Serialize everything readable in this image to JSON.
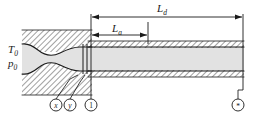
{
  "figure": {
    "colors": {
      "line": "#1a1a1a",
      "duct_fill": "#e2e2e2",
      "wall_fill": "#ffffff",
      "hatch": "#2b2b2b",
      "background": "#ffffff"
    },
    "reservoir": {
      "labels": [
        {
          "id": "stagnation-temperature",
          "symbol": "T",
          "subscript": "0"
        },
        {
          "id": "stagnation-pressure",
          "symbol": "p",
          "subscript": "0"
        }
      ]
    },
    "dimensions": [
      {
        "id": "duct-length-d",
        "symbol": "L",
        "subscript": "d",
        "label": "Ld",
        "arrow_style": "double",
        "from_station": "1",
        "to_station": "*"
      },
      {
        "id": "duct-length-a",
        "symbol": "L",
        "subscript": "a",
        "label": "La",
        "arrow_style": "double",
        "from_station": "1",
        "to_station": "a"
      }
    ],
    "stations": [
      {
        "id": "station-x",
        "label": "x",
        "style": "italic",
        "note": "upstream of shock"
      },
      {
        "id": "station-y",
        "label": "y",
        "style": "italic",
        "note": "downstream of shock"
      },
      {
        "id": "station-1",
        "label": "1",
        "style": "upright",
        "note": "duct inlet"
      },
      {
        "id": "station-star",
        "label": "*",
        "style": "upright",
        "note": "sonic / choked exit"
      }
    ]
  }
}
